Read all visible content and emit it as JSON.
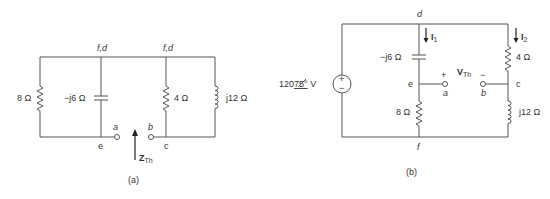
{
  "figure_a": {
    "caption": "(a)",
    "node_top_left": "f,d",
    "node_top_right": "f,d",
    "node_e": "e",
    "node_c": "c",
    "terminal_a": "a",
    "terminal_b": "b",
    "r1_label": "8 Ω",
    "cap_label": "−j6 Ω",
    "r2_label": "4 Ω",
    "ind_label": "j12 Ω",
    "zth_main": "Z",
    "zth_sub": "Th"
  },
  "figure_b": {
    "caption": "(b)",
    "node_d": "d",
    "node_e": "e",
    "node_f": "f",
    "node_c": "c",
    "terminal_a": "a",
    "terminal_b": "b",
    "source_mag": "120",
    "source_angle": "75°",
    "source_unit": " V",
    "source_plus": "+",
    "source_minus": "−",
    "cap_label": "−j6 Ω",
    "r8_label": "8 Ω",
    "r4_label": "4 Ω",
    "ind_label": "j12 Ω",
    "i1_main": "I",
    "i1_sub": "1",
    "i2_main": "I",
    "i2_sub": "2",
    "vth_main": "V",
    "vth_sub": "Th",
    "vth_plus": "+",
    "vth_minus": "−"
  }
}
